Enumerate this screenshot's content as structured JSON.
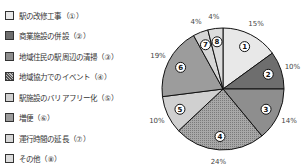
{
  "chart_data": {
    "type": "pie",
    "title": "",
    "legend_position": "left",
    "start_angle_deg": 0,
    "direction": "clockwise",
    "categories": [
      "駅の改修工事（①）",
      "商業施設の併設（②）",
      "地域住民の駅周辺の清掃（③）",
      "地域協力でのイベント（④）",
      "駅施設のバリアフリー化（⑤）",
      "増便（⑥）",
      "運行時間の延長（⑦）",
      "その他（⑧）"
    ],
    "slice_numbers": [
      "1",
      "2",
      "3",
      "4",
      "5",
      "6",
      "7",
      "8"
    ],
    "values": [
      15,
      10,
      14,
      24,
      10,
      19,
      4,
      4
    ],
    "value_labels": [
      "15%",
      "10%",
      "14%",
      "24%",
      "10%",
      "19%",
      "4%",
      "4%"
    ],
    "colors": [
      "#e8e8e8",
      "#6e6e6e",
      "#8e8e8e",
      "#9a9a9a",
      "#d0d0d0",
      "#9c9c9c",
      "#d6d6d6",
      "#dcdcdc"
    ]
  }
}
